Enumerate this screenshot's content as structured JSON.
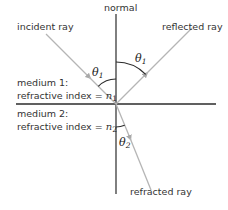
{
  "diagram": {
    "labels": {
      "normal": "normal",
      "incident_ray": "incident ray",
      "reflected_ray": "reflected ray",
      "refracted_ray": "refracted ray",
      "medium1_name": "medium 1:",
      "medium1_index_text": "refractive index = ",
      "medium1_symbol": "n",
      "medium1_subscript": "1",
      "medium2_name": "medium 2:",
      "medium2_index_text": "refractive index = ",
      "medium2_symbol": "n",
      "medium2_subscript": "2",
      "theta_symbol": "θ",
      "angle_incident_sub": "1",
      "angle_reflected_sub": "1",
      "angle_refracted_sub": "2"
    },
    "colors": {
      "axis_lines": "#2b2b2b",
      "rays": "#b5b5b5",
      "arcs": "#2b2b2b",
      "text": "#333333"
    }
  }
}
